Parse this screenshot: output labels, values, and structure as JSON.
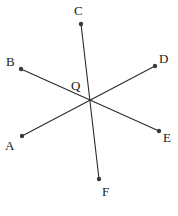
{
  "figure": {
    "type": "geometry-diagram",
    "width": 178,
    "height": 216,
    "background_color": "#ffffff",
    "stroke_color": "#2b2b2b",
    "label_color": "#1a1a1a",
    "dot_color": "#3a3a3a",
    "stroke_width": 1.1,
    "dot_radius": 2.2,
    "center": {
      "name": "Q",
      "label": "Q",
      "x": 88,
      "y": 102,
      "label_x": 71,
      "label_y": 79
    },
    "endpoints": [
      {
        "name": "A",
        "label": "A",
        "x": 22,
        "y": 136,
        "label_x": 5,
        "label_y": 139
      },
      {
        "name": "B",
        "label": "B",
        "x": 21,
        "y": 69,
        "label_x": 6,
        "label_y": 55
      },
      {
        "name": "C",
        "label": "C",
        "x": 81,
        "y": 24,
        "label_x": 74,
        "label_y": 4
      },
      {
        "name": "D",
        "label": "D",
        "x": 155,
        "y": 66,
        "label_x": 159,
        "label_y": 52
      },
      {
        "name": "E",
        "label": "E",
        "x": 159,
        "y": 131,
        "label_x": 163,
        "label_y": 131
      },
      {
        "name": "F",
        "label": "F",
        "x": 99,
        "y": 179,
        "label_x": 102,
        "label_y": 185
      }
    ],
    "lines": [
      {
        "name": "line-AD",
        "from": "A",
        "to": "D"
      },
      {
        "name": "line-BE",
        "from": "B",
        "to": "E"
      },
      {
        "name": "line-CF",
        "from": "C",
        "to": "F"
      }
    ]
  }
}
